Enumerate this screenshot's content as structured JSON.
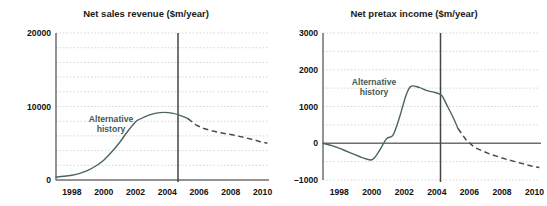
{
  "figure": {
    "panels": [
      {
        "key": "net_sales_revenue",
        "title": "Net sales revenue ($m/year)",
        "annotation_line1": "Alternative",
        "annotation_line2": "history",
        "y_ticks": [
          "20000",
          "10000",
          "0"
        ],
        "x_ticks": [
          "1998",
          "2000",
          "2002",
          "2004",
          "2006",
          "2008",
          "2010"
        ]
      },
      {
        "key": "net_pretax_income",
        "title": "Net pretax income ($m/year)",
        "annotation_line1": "Alternative",
        "annotation_line2": "history",
        "y_ticks": [
          "3000",
          "2000",
          "1000",
          "0",
          "–1000"
        ],
        "x_ticks": [
          "1998",
          "2000",
          "2002",
          "2004",
          "2006",
          "2008",
          "2010"
        ]
      }
    ]
  },
  "colors": {
    "series_solid": "#4a6561",
    "series_dashed": "#4a4a4a",
    "gridline": "#c9c4c4",
    "axis": "#6f6f6f",
    "divider": "#444444",
    "annotation_text": "#3f5b57",
    "tick_text": "#111111",
    "title_text": "#1a1a1a",
    "background": "#ffffff"
  },
  "chart_data": [
    {
      "type": "line",
      "title": "Net sales revenue ($m/year)",
      "xlabel": "",
      "ylabel": "$m/year",
      "xlim": [
        1997.0,
        2010.4
      ],
      "ylim": [
        0,
        20000
      ],
      "xticks": [
        1998,
        2000,
        2002,
        2004,
        2006,
        2008,
        2010
      ],
      "yticks": [
        0,
        10000,
        20000
      ],
      "ytick_labels": [
        "0",
        "10000",
        "20000"
      ],
      "gridlines": {
        "y_minor_step": 2000,
        "y_values": [
          2000,
          4000,
          6000,
          8000,
          10000,
          12000,
          14000,
          16000,
          18000,
          20000
        ],
        "style": "dotted",
        "x_grid": false
      },
      "legend": "none",
      "annotations": [
        {
          "text": "Alternative history",
          "x": 2000.6,
          "y": 7600
        }
      ],
      "vertical_marker": {
        "x": 2005.3,
        "label": ""
      },
      "series": [
        {
          "name": "Alternative history (actual)",
          "style": "solid",
          "x": [
            1997.0,
            1997.5,
            1998.0,
            1998.5,
            1999.0,
            1999.5,
            2000.0,
            2000.5,
            2001.0,
            2001.5,
            2002.0,
            2002.3,
            2002.8,
            2003.3,
            2003.8,
            2004.3,
            2004.8,
            2005.3
          ],
          "y": [
            400,
            500,
            650,
            900,
            1300,
            1900,
            2700,
            3800,
            5100,
            6600,
            7900,
            8300,
            8800,
            9100,
            9200,
            9100,
            8800,
            8350
          ]
        },
        {
          "name": "Alternative history (projected)",
          "style": "dashed",
          "x": [
            2005.3,
            2005.8,
            2006.3,
            2006.8,
            2007.3,
            2007.8,
            2008.3,
            2008.8,
            2009.3,
            2009.8,
            2010.3
          ],
          "y": [
            8350,
            7500,
            7000,
            6700,
            6450,
            6250,
            6050,
            5800,
            5550,
            5250,
            5000
          ]
        }
      ]
    },
    {
      "type": "line",
      "title": "Net pretax income ($m/year)",
      "xlabel": "",
      "ylabel": "$m/year",
      "xlim": [
        1997.0,
        2010.4
      ],
      "ylim": [
        -1000,
        3000
      ],
      "xticks": [
        1998,
        2000,
        2002,
        2004,
        2006,
        2008,
        2010
      ],
      "yticks": [
        -1000,
        0,
        1000,
        2000,
        3000
      ],
      "ytick_labels": [
        "–1000",
        "0",
        "1000",
        "2000",
        "3000"
      ],
      "gridlines": {
        "y_minor_step": 500,
        "y_values": [
          -1000,
          -500,
          0,
          500,
          1000,
          1500,
          2000,
          2500,
          3000
        ],
        "style": "dotted",
        "x_grid": false
      },
      "legend": "none",
      "annotations": [
        {
          "text": "Alternative history",
          "x": 2000.9,
          "y": 1950
        }
      ],
      "vertical_marker": {
        "x": 2005.3,
        "label": ""
      },
      "zero_line": 0,
      "series": [
        {
          "name": "Alternative history (actual)",
          "style": "solid",
          "x": [
            1997.0,
            1997.6,
            1998.2,
            1998.8,
            1999.4,
            2000.0,
            2000.4,
            2000.9,
            2001.3,
            2001.7,
            2002.1,
            2002.4,
            2002.9,
            2003.4,
            2003.9,
            2004.3,
            2004.6,
            2005.0,
            2005.3
          ],
          "y": [
            0,
            -70,
            -170,
            -280,
            -390,
            -450,
            -250,
            120,
            220,
            700,
            1300,
            1550,
            1520,
            1430,
            1380,
            1300,
            1050,
            700,
            400
          ]
        },
        {
          "name": "Alternative history (projected)",
          "style": "dashed",
          "x": [
            2005.3,
            2005.8,
            2006.3,
            2006.8,
            2007.3,
            2007.8,
            2008.3,
            2008.8,
            2009.3,
            2009.8,
            2010.3
          ],
          "y": [
            400,
            90,
            -110,
            -210,
            -300,
            -370,
            -440,
            -500,
            -560,
            -620,
            -660
          ]
        }
      ]
    }
  ]
}
